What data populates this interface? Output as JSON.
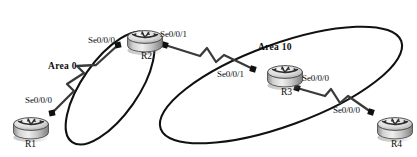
{
  "diagram": {
    "type": "network-topology",
    "areas": [
      {
        "id": "area-0",
        "label": "Area 0",
        "x": 48,
        "y": 62,
        "rotation": -33
      },
      {
        "id": "area-10",
        "label": "Area 10",
        "x": 258,
        "y": 43,
        "rotation": -18
      }
    ],
    "routers": [
      {
        "id": "r1",
        "label": "R1",
        "label_x": 25,
        "label_y": 140,
        "icon_x": 12,
        "icon_y": 112
      },
      {
        "id": "r2",
        "label": "R2",
        "label_x": 141,
        "label_y": 52,
        "icon_x": 126,
        "icon_y": 25
      },
      {
        "id": "r3",
        "label": "R3",
        "label_x": 281,
        "label_y": 88,
        "icon_x": 266,
        "icon_y": 60
      },
      {
        "id": "r4",
        "label": "R4",
        "label_x": 391,
        "label_y": 140,
        "icon_x": 376,
        "icon_y": 112
      }
    ],
    "interfaces": [
      {
        "id": "r1-se000",
        "label": "Se0/0/0",
        "x": 25,
        "y": 96,
        "router": "r1"
      },
      {
        "id": "r2-se000",
        "label": "Se0/0/0",
        "x": 88,
        "y": 36,
        "router": "r2"
      },
      {
        "id": "r2-se001",
        "label": "Se0/0/1",
        "x": 160,
        "y": 30,
        "router": "r2"
      },
      {
        "id": "r3-se001",
        "label": "Se0/0/1",
        "x": 217,
        "y": 70,
        "router": "r3"
      },
      {
        "id": "r3-se000",
        "label": "Se0/0/0",
        "x": 302,
        "y": 74,
        "router": "r3"
      },
      {
        "id": "r4-se000",
        "label": "Se0/0/0",
        "x": 333,
        "y": 106,
        "router": "r4"
      }
    ],
    "links": [
      {
        "id": "link-r1-r2",
        "from": "r1",
        "to": "r2",
        "style": "serial-zigzag",
        "area": "area-0"
      },
      {
        "id": "link-r2-r3",
        "from": "r2",
        "to": "r3",
        "style": "serial-zigzag",
        "area": "area-10"
      },
      {
        "id": "link-r3-r4",
        "from": "r3",
        "to": "r4",
        "style": "serial-zigzag",
        "area": "area-10"
      }
    ],
    "colors": {
      "background": "#ffffff",
      "ellipse_stroke": "#111111",
      "link_stroke": "#3a3a3a",
      "endpoint_dot": "#101010",
      "text": "#0d0d0d",
      "router_body_light": "#f0f0f0",
      "router_body_mid": "#b9b9b9",
      "router_body_dark": "#8a8a8a",
      "router_outline": "#3f3f3f"
    }
  }
}
